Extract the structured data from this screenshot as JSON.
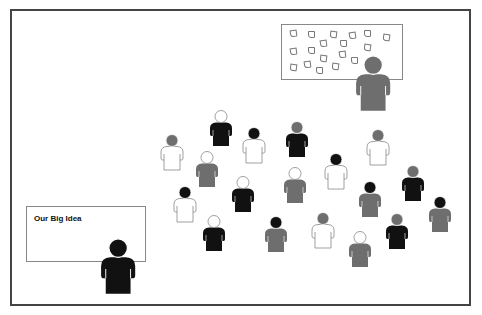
{
  "colors": {
    "black": "#111111",
    "gray": "#6e6e6e",
    "white": "#ffffff",
    "outline": "#888888",
    "frame": "#444444"
  },
  "left_board": {
    "title": "Our Big Idea"
  },
  "top_board": {
    "sticky_note_count": 20
  },
  "presenters": [
    {
      "role": "presenter-top-right",
      "x": 373,
      "y": 55,
      "scale": 1.55,
      "head": "gray",
      "body": "gray"
    },
    {
      "role": "presenter-bottom-left",
      "x": 118,
      "y": 238,
      "scale": 1.55,
      "head": "black",
      "body": "black"
    }
  ],
  "crowd": [
    {
      "x": 221,
      "y": 110,
      "head": "white",
      "body": "black"
    },
    {
      "x": 254,
      "y": 127,
      "head": "black",
      "body": "white"
    },
    {
      "x": 297,
      "y": 121,
      "head": "gray",
      "body": "black"
    },
    {
      "x": 378,
      "y": 129,
      "head": "gray",
      "body": "white"
    },
    {
      "x": 172,
      "y": 134,
      "head": "gray",
      "body": "white"
    },
    {
      "x": 207,
      "y": 151,
      "head": "white",
      "body": "gray"
    },
    {
      "x": 336,
      "y": 153,
      "head": "black",
      "body": "white"
    },
    {
      "x": 295,
      "y": 167,
      "head": "white",
      "body": "gray"
    },
    {
      "x": 243,
      "y": 176,
      "head": "white",
      "body": "black"
    },
    {
      "x": 413,
      "y": 165,
      "head": "gray",
      "body": "black"
    },
    {
      "x": 370,
      "y": 181,
      "head": "black",
      "body": "gray"
    },
    {
      "x": 185,
      "y": 186,
      "head": "black",
      "body": "white"
    },
    {
      "x": 440,
      "y": 196,
      "head": "black",
      "body": "gray"
    },
    {
      "x": 214,
      "y": 215,
      "head": "white",
      "body": "black"
    },
    {
      "x": 276,
      "y": 216,
      "head": "black",
      "body": "gray"
    },
    {
      "x": 323,
      "y": 212,
      "head": "gray",
      "body": "white"
    },
    {
      "x": 397,
      "y": 213,
      "head": "gray",
      "body": "black"
    },
    {
      "x": 360,
      "y": 231,
      "head": "white",
      "body": "gray"
    }
  ],
  "sticky_notes": [
    {
      "x": 290,
      "y": 30
    },
    {
      "x": 308,
      "y": 31
    },
    {
      "x": 330,
      "y": 31
    },
    {
      "x": 349,
      "y": 32
    },
    {
      "x": 364,
      "y": 30
    },
    {
      "x": 383,
      "y": 34
    },
    {
      "x": 320,
      "y": 40
    },
    {
      "x": 340,
      "y": 40
    },
    {
      "x": 364,
      "y": 44
    },
    {
      "x": 290,
      "y": 48
    },
    {
      "x": 308,
      "y": 47
    },
    {
      "x": 320,
      "y": 55
    },
    {
      "x": 339,
      "y": 51
    },
    {
      "x": 351,
      "y": 57
    },
    {
      "x": 290,
      "y": 64
    },
    {
      "x": 304,
      "y": 61
    },
    {
      "x": 316,
      "y": 67
    },
    {
      "x": 332,
      "y": 63
    }
  ]
}
